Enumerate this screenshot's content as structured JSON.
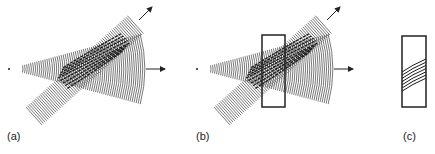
{
  "figure": {
    "colors": {
      "line": "#555555",
      "dark": "#1a1a1a",
      "box": "#222222",
      "background": "#ffffff"
    },
    "panels": [
      {
        "id": "a",
        "label": "(a)",
        "content": "spherical wave from point source intersecting plane-wave beam, interference fringes in overlap"
      },
      {
        "id": "b",
        "label": "(b)",
        "content": "same as (a) with recording plate (rectangle) placed in overlap region"
      },
      {
        "id": "c",
        "label": "(c)",
        "content": "recording plate with recorded slanted fringes"
      }
    ],
    "arrows": [
      {
        "panel": "a",
        "direction": "horizontal-right",
        "meaning": "spherical wave propagation"
      },
      {
        "panel": "a",
        "direction": "diagonal-up-right",
        "meaning": "plane wave propagation"
      },
      {
        "panel": "b",
        "direction": "horizontal-right",
        "meaning": "spherical wave propagation"
      },
      {
        "panel": "b",
        "direction": "diagonal-up-right",
        "meaning": "plane wave propagation"
      }
    ]
  }
}
